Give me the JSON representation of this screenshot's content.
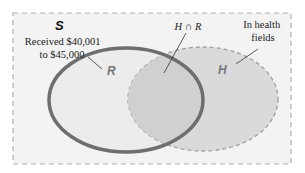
{
  "diagram": {
    "type": "venn",
    "universe": {
      "label": "S"
    },
    "sets": [
      {
        "id": "R",
        "label": "R",
        "description_lines": [
          "Received $40,001",
          "to $45,000"
        ],
        "border": "solid"
      },
      {
        "id": "H",
        "label": "H",
        "description_lines": [
          "In health",
          "fields"
        ],
        "border": "dashed"
      }
    ],
    "intersection": {
      "label": "H ∩ R"
    },
    "colors": {
      "universe_fill": "#f3f3f3",
      "universe_border": "#b0b0b0",
      "R_fill": "#ececec",
      "R_border": "#6e6e6e",
      "H_fill": "#dadada",
      "H_border": "#a0a0a0",
      "intersection_fill": "#d0d0d0",
      "label_color": "#777777",
      "text_color": "#222222"
    }
  }
}
